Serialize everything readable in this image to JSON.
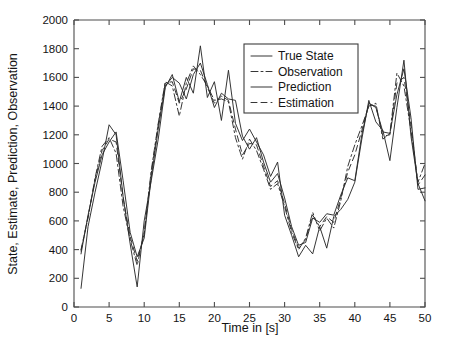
{
  "chart_data": {
    "type": "line",
    "title": "",
    "xlabel": "Time in [s]",
    "ylabel": "State, Estimate, Prediction, Observation",
    "xlim": [
      0,
      50
    ],
    "ylim": [
      0,
      2000
    ],
    "xticks": [
      0,
      5,
      10,
      15,
      20,
      25,
      30,
      35,
      40,
      45,
      50
    ],
    "yticks": [
      0,
      200,
      400,
      600,
      800,
      1000,
      1200,
      1400,
      1600,
      1800,
      2000
    ],
    "grid": false,
    "legend_position": "top-center-right",
    "line_color": "#2b2b2b",
    "background_color": "#ffffff",
    "x": [
      1,
      2,
      3,
      4,
      5,
      6,
      7,
      8,
      9,
      10,
      11,
      12,
      13,
      14,
      15,
      16,
      17,
      18,
      19,
      20,
      21,
      22,
      23,
      24,
      25,
      26,
      27,
      28,
      29,
      30,
      31,
      32,
      33,
      34,
      35,
      36,
      37,
      38,
      39,
      40,
      41,
      42,
      43,
      44,
      45,
      46,
      47,
      48,
      49,
      50
    ],
    "series": [
      {
        "name": "True State",
        "style": "solid",
        "dash": "none",
        "values": [
          130,
          560,
          800,
          1020,
          1270,
          1200,
          770,
          440,
          140,
          600,
          880,
          1170,
          1530,
          1620,
          1430,
          1600,
          1490,
          1820,
          1460,
          1570,
          1300,
          1650,
          1280,
          1160,
          1240,
          1150,
          1060,
          910,
          1010,
          640,
          500,
          350,
          430,
          370,
          560,
          410,
          630,
          680,
          750,
          870,
          1170,
          1440,
          1290,
          1230,
          1020,
          1390,
          1720,
          1190,
          860,
          740
        ]
      },
      {
        "name": "Observation",
        "style": "dash-dot",
        "dash": "7,3,2,3",
        "values": [
          400,
          620,
          900,
          1120,
          1180,
          1070,
          700,
          470,
          290,
          520,
          950,
          1280,
          1570,
          1540,
          1330,
          1560,
          1680,
          1620,
          1540,
          1440,
          1450,
          1430,
          1180,
          1030,
          1170,
          1090,
          960,
          820,
          860,
          700,
          520,
          400,
          480,
          660,
          530,
          620,
          550,
          740,
          980,
          1130,
          1260,
          1400,
          1420,
          1170,
          1210,
          1630,
          1540,
          1230,
          870,
          1000
        ]
      },
      {
        "name": "Prediction",
        "style": "solid",
        "dash": "none",
        "values": [
          370,
          640,
          870,
          1060,
          1150,
          1220,
          880,
          520,
          350,
          480,
          900,
          1240,
          1540,
          1600,
          1560,
          1450,
          1620,
          1700,
          1550,
          1390,
          1490,
          1450,
          1440,
          1190,
          1100,
          1180,
          1010,
          870,
          930,
          760,
          560,
          430,
          450,
          620,
          590,
          650,
          640,
          780,
          900,
          880,
          1200,
          1420,
          1390,
          1220,
          1210,
          1480,
          1660,
          1320,
          820,
          830
        ]
      },
      {
        "name": "Estimation",
        "style": "dashed",
        "dash": "6,4",
        "values": [
          390,
          630,
          890,
          1090,
          1170,
          1150,
          760,
          490,
          320,
          510,
          930,
          1270,
          1560,
          1570,
          1420,
          1520,
          1660,
          1650,
          1530,
          1420,
          1470,
          1440,
          1240,
          1060,
          1140,
          1130,
          980,
          840,
          880,
          720,
          540,
          410,
          470,
          640,
          560,
          630,
          590,
          760,
          940,
          1060,
          1230,
          1410,
          1400,
          1190,
          1200,
          1560,
          1600,
          1270,
          850,
          920
        ]
      }
    ]
  },
  "legend": {
    "entries": [
      {
        "label": "True State"
      },
      {
        "label": "Observation"
      },
      {
        "label": "Prediction"
      },
      {
        "label": "Estimation"
      }
    ]
  }
}
